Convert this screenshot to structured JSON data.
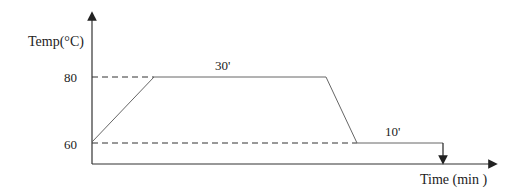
{
  "y_axis": {
    "label": "Temp(°C)",
    "ticks": [
      "80",
      "60"
    ]
  },
  "x_axis": {
    "label": "Time (min )"
  },
  "segments": {
    "hold_high": "30'",
    "hold_low": "10'"
  },
  "colors": {
    "line": "#555555",
    "axis": "#333333"
  }
}
